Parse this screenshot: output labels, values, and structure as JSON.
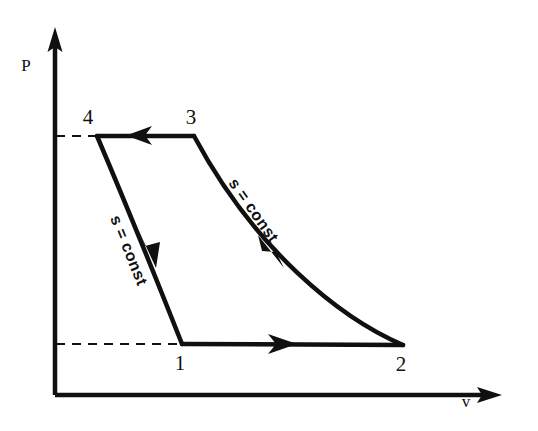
{
  "figure": {
    "kind": "pressure-volume-diagram",
    "background_color": "#ffffff",
    "ink_color": "#101010"
  },
  "axes": {
    "y_label": "P",
    "x_label": "v",
    "origin": [
      55,
      395
    ],
    "y_axis_top": [
      55,
      30
    ],
    "x_axis_right": [
      500,
      395
    ]
  },
  "points": [
    {
      "id": "4",
      "label": "4",
      "x": 97,
      "y": 136,
      "label_x": 88,
      "label_y": 124
    },
    {
      "id": "3",
      "label": "3",
      "x": 194,
      "y": 136,
      "label_x": 185,
      "label_y": 124
    },
    {
      "id": "1",
      "label": "1",
      "x": 182,
      "y": 344,
      "label_x": 174,
      "label_y": 370
    },
    {
      "id": "2",
      "label": "2",
      "x": 403,
      "y": 345,
      "label_x": 395,
      "label_y": 371
    }
  ],
  "processes": [
    {
      "id": "3-4",
      "from": "3",
      "to": "4",
      "shape": "straight",
      "label": "",
      "arrow_direction": "left"
    },
    {
      "id": "4-1",
      "from": "4",
      "to": "1",
      "shape": "curved",
      "label": "s = const",
      "arrow_direction": "down"
    },
    {
      "id": "1-2",
      "from": "1",
      "to": "2",
      "shape": "straight",
      "label": "",
      "arrow_direction": "right"
    },
    {
      "id": "2-3",
      "from": "2",
      "to": "3",
      "shape": "curved",
      "label": "s = const",
      "arrow_direction": "up-left"
    }
  ],
  "guides": [
    {
      "id": "upper-dashed",
      "from": [
        56,
        136
      ],
      "to": [
        97,
        136
      ]
    },
    {
      "id": "lower-dashed",
      "from": [
        56,
        344
      ],
      "to": [
        182,
        344
      ]
    }
  ],
  "curve_labels": {
    "left": "s = const",
    "right": "s = const"
  }
}
